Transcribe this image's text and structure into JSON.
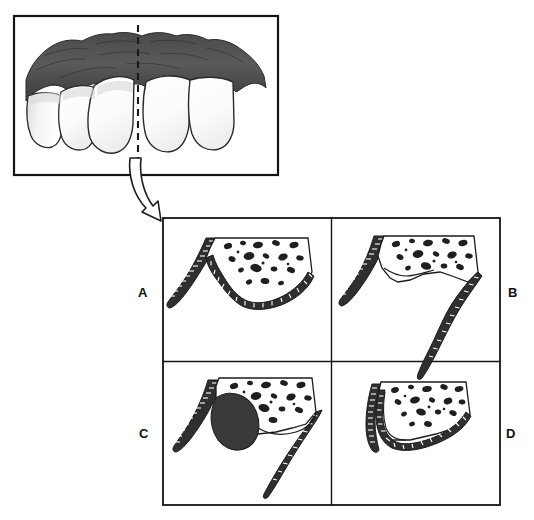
{
  "figure": {
    "kind": "dental-illustration",
    "title_text": "",
    "background_color": "#ffffff",
    "ink_color": "#1a1a1a",
    "bone_fill_color": "#ffffff",
    "tissue_dark_color": "#3a3a3a",
    "tooth_fill_color": "#fdfdfd"
  },
  "clinical_photo": {
    "name": "anterior-teeth-gingiva-view",
    "frame": {
      "x": 14,
      "y": 16,
      "width": 264,
      "height": 159
    },
    "description_alt": "Frontal clinical view of upper anterior teeth with dark gingival tissue above",
    "section_line": {
      "name": "vertical-section-line",
      "style": "dashed",
      "x": 138,
      "y_top": 25,
      "y_bottom": 170
    },
    "teeth_left": 3,
    "teeth_right": 2
  },
  "arrow": {
    "name": "section-pointer-arrow",
    "style": "outlined-curved",
    "from": {
      "x": 135,
      "y": 165
    },
    "to": {
      "x": 168,
      "y": 220
    }
  },
  "grid": {
    "frame": {
      "x": 163,
      "y": 218,
      "width": 337,
      "height": 287
    },
    "columns": 2,
    "rows": 2,
    "border_color": "#1a1a1a"
  },
  "panels": [
    {
      "id": "A",
      "label": "A",
      "label_side": "left",
      "name": "panel-a-horizontal-bone-loss",
      "cell": {
        "x": 163,
        "y": 218,
        "width": 168,
        "height": 143
      },
      "caption_alt": "Horizontal bone loss: suprabony defect with bone crest perpendicular to root"
    },
    {
      "id": "B",
      "label": "B",
      "label_side": "right",
      "name": "panel-b-vertical-bone-loss",
      "cell": {
        "x": 331,
        "y": 218,
        "width": 169,
        "height": 143
      },
      "caption_alt": "Vertical/angular bone loss: infrabony defect along the root"
    },
    {
      "id": "C",
      "label": "C",
      "label_side": "left",
      "name": "panel-c-interproximal-crater",
      "cell": {
        "x": 163,
        "y": 361,
        "width": 168,
        "height": 144
      },
      "caption_alt": "Interproximal crater defect with soft tissue mass between roots"
    },
    {
      "id": "D",
      "label": "D",
      "label_side": "right",
      "name": "panel-d-shallow-bone-loss",
      "cell": {
        "x": 331,
        "y": 361,
        "width": 169,
        "height": 144
      },
      "caption_alt": "Shallow/early bone loss with intact crest"
    }
  ],
  "legend": {
    "bone": "trabecular bone",
    "root": "tooth root with periodontal ligament hatching",
    "cortical": "cortical plate"
  }
}
